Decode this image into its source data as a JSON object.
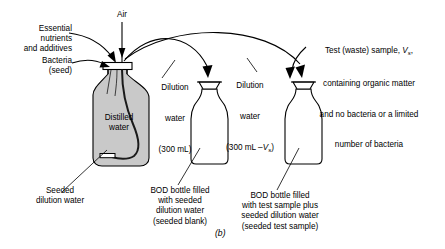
{
  "figure": {
    "caption": "(b)"
  },
  "labels": {
    "air": "Air",
    "essential_nutrients": "Essential\nnutrients\nand additives",
    "bacteria_seed": "Bacteria\n(seed)",
    "distilled_water": "Distilled\nwater",
    "seeded_dilution_water": "Seeded\ndilution water",
    "dilution_water_1_line1": "Dilution",
    "dilution_water_1_line2": "water",
    "dilution_water_1_line3": "(300 mL)",
    "dilution_water_2_line1": "Dilution",
    "dilution_water_2_line2": "water",
    "dilution_water_2_line3_pre": "(300 mL –",
    "dilution_water_2_line3_var": "V",
    "dilution_water_2_line3_sub": "s",
    "dilution_water_2_line3_post": ")",
    "test_sample_line1_pre": "Test (waste) sample, ",
    "test_sample_line1_var": "V",
    "test_sample_line1_sub": "s",
    "test_sample_line1_post": ",",
    "test_sample_line2": "containing organic matter",
    "test_sample_line3": "and no bacteria or a limited",
    "test_sample_line4": "number of bacteria",
    "bod_bottle_1": "BOD bottle filled\nwith seeded\ndilution water\n(seeded blank)",
    "bod_bottle_2": "BOD bottle filled\nwith test sample plus\nseeded dilution water\n(seeded test sample)"
  },
  "colors": {
    "ink": "#000000",
    "water_fill": "#c9c9c9",
    "page": "#ffffff"
  }
}
